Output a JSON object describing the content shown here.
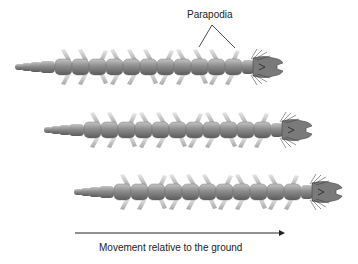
{
  "diagram": {
    "callout_label": "Parapodia",
    "arrow_caption": "Movement relative to the ground",
    "worms": [
      {
        "id": "worm-1",
        "tail_x": 15,
        "center_y": 67,
        "segments": 11
      },
      {
        "id": "worm-2",
        "tail_x": 44,
        "center_y": 130,
        "segments": 11
      },
      {
        "id": "worm-3",
        "tail_x": 74,
        "center_y": 192,
        "segments": 11
      }
    ],
    "colors": {
      "body": "#8a8a8a",
      "body_highlight": "#bdbdbd",
      "body_shadow": "#5e5e5e",
      "parapodia": "#b5b5b5",
      "line": "#222222"
    }
  }
}
